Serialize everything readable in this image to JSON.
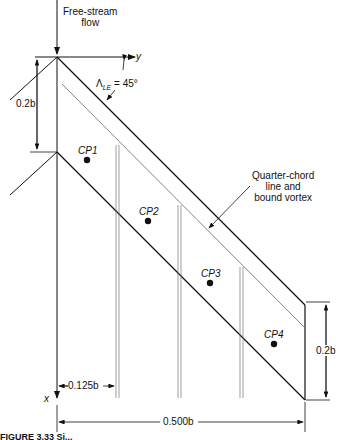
{
  "diagram": {
    "labels": {
      "free_stream_line1": "Free-stream",
      "free_stream_line2": "flow",
      "y_axis": "y",
      "x_axis": "x",
      "sweep_symbol": "Λ",
      "sweep_sub": "LE",
      "sweep_value": "= 45°",
      "quarter_chord_line1": "Quarter-chord",
      "quarter_chord_line2": "line and",
      "quarter_chord_line3": "bound vortex",
      "dim_root_chord": "0.2b",
      "dim_tip_chord": "0.2b",
      "dim_panel_width": "0.125b",
      "dim_semispan": "0.500b"
    },
    "control_points": [
      {
        "label": "CP1"
      },
      {
        "label": "CP2"
      },
      {
        "label": "CP3"
      },
      {
        "label": "CP4"
      }
    ],
    "caption": "FIGURE 3.33  Si..."
  }
}
